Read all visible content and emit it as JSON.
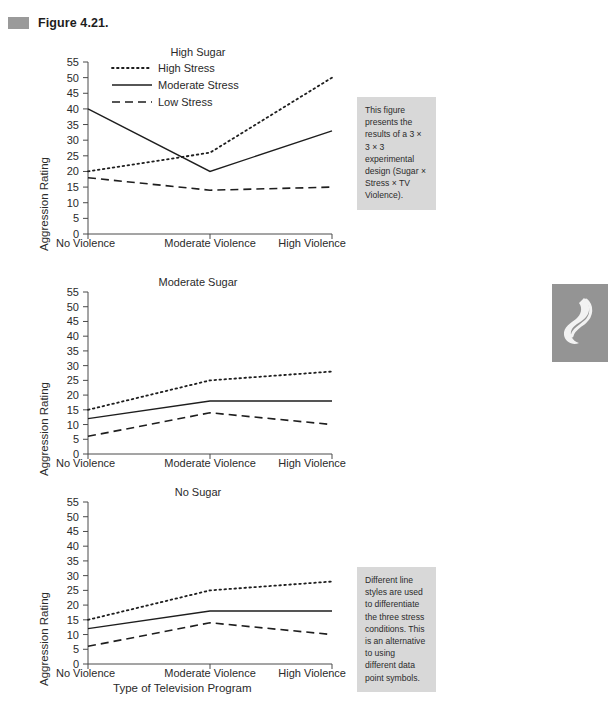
{
  "figure": {
    "marker_icon": "gray-square-marker",
    "label": "Figure 4.21."
  },
  "axis": {
    "ylabel": "Aggression Rating",
    "xlabel": "Type of Television Program",
    "yticks": [
      "0",
      "5",
      "10",
      "15",
      "20",
      "25",
      "30",
      "35",
      "40",
      "45",
      "50",
      "55"
    ],
    "categories": [
      "No Violence",
      "Moderate Violence",
      "High Violence"
    ]
  },
  "legend": {
    "items": [
      {
        "label": "High Stress",
        "style": "dotted"
      },
      {
        "label": "Moderate Stress",
        "style": "solid"
      },
      {
        "label": "Low Stress",
        "style": "dashed"
      }
    ]
  },
  "notes": [
    {
      "id": "note-design",
      "text": "This figure presents the results of a 3 × 3 × 3 experimental design (Sugar × Stress × TV Violence)."
    },
    {
      "id": "note-linestyles",
      "text": "Different line styles are used to differentiate the three stress conditions. This is an alternative to using different data point symbols."
    }
  ],
  "decoration": {
    "icon": "swirl-flourish-icon"
  },
  "chart_data": [
    {
      "type": "line",
      "title": "High Sugar",
      "xlabel": "",
      "ylabel": "Aggression Rating",
      "categories": [
        "No Violence",
        "Moderate Violence",
        "High Violence"
      ],
      "ylim": [
        0,
        55
      ],
      "ytick_step": 5,
      "grid": false,
      "legend_position": "top-left-inside",
      "series": [
        {
          "name": "High Stress",
          "style": "dotted",
          "values": [
            20,
            26,
            50
          ]
        },
        {
          "name": "Moderate Stress",
          "style": "solid",
          "values": [
            40,
            20,
            33
          ]
        },
        {
          "name": "Low Stress",
          "style": "dashed",
          "values": [
            18,
            14,
            15
          ]
        }
      ]
    },
    {
      "type": "line",
      "title": "Moderate Sugar",
      "xlabel": "",
      "ylabel": "Aggression Rating",
      "categories": [
        "No Violence",
        "Moderate Violence",
        "High Violence"
      ],
      "ylim": [
        0,
        55
      ],
      "ytick_step": 5,
      "grid": false,
      "legend_position": "none",
      "series": [
        {
          "name": "High Stress",
          "style": "dotted",
          "values": [
            15,
            25,
            28
          ]
        },
        {
          "name": "Moderate Stress",
          "style": "solid",
          "values": [
            12,
            18,
            18
          ]
        },
        {
          "name": "Low Stress",
          "style": "dashed",
          "values": [
            6,
            14,
            10
          ]
        }
      ]
    },
    {
      "type": "line",
      "title": "No Sugar",
      "xlabel": "Type of Television Program",
      "ylabel": "Aggression Rating",
      "categories": [
        "No Violence",
        "Moderate Violence",
        "High Violence"
      ],
      "ylim": [
        0,
        55
      ],
      "ytick_step": 5,
      "grid": false,
      "legend_position": "none",
      "series": [
        {
          "name": "High Stress",
          "style": "dotted",
          "values": [
            15,
            25,
            28
          ]
        },
        {
          "name": "Moderate Stress",
          "style": "solid",
          "values": [
            12,
            18,
            18
          ]
        },
        {
          "name": "Low Stress",
          "style": "dashed",
          "values": [
            6,
            14,
            10
          ]
        }
      ]
    }
  ]
}
